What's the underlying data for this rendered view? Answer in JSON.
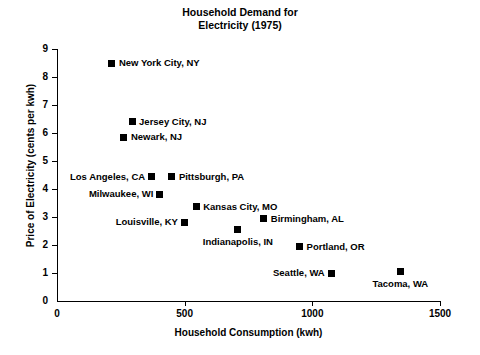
{
  "chart_data": {
    "type": "scatter",
    "title": "Household Demand for Electricity (1975)",
    "title_lines": [
      "Household Demand for",
      "Electricity (1975)"
    ],
    "xlabel": "Household Consumption (kwh)",
    "ylabel": "Price of Electricity (cents per kwh)",
    "xlim": [
      0,
      1500
    ],
    "ylim": [
      0,
      9
    ],
    "xticks": [
      0,
      500,
      1000,
      1500
    ],
    "yticks": [
      0,
      1,
      2,
      3,
      4,
      5,
      6,
      7,
      8,
      9
    ],
    "grid": false,
    "legend": "none",
    "marker": "filled-square",
    "marker_color": "#000000",
    "points": [
      {
        "label": "New York City, NY",
        "x": 215,
        "y": 8.5,
        "side": "right"
      },
      {
        "label": "Jersey City, NJ",
        "x": 294,
        "y": 6.4,
        "side": "right"
      },
      {
        "label": "Newark, NJ",
        "x": 262,
        "y": 5.85,
        "side": "right"
      },
      {
        "label": "Los Angeles, CA",
        "x": 372,
        "y": 4.43,
        "side": "left"
      },
      {
        "label": "Pittsburgh, PA",
        "x": 450,
        "y": 4.43,
        "side": "right"
      },
      {
        "label": "Milwaukee, WI",
        "x": 403,
        "y": 3.82,
        "side": "left"
      },
      {
        "label": "Kansas City, MO",
        "x": 545,
        "y": 3.36,
        "side": "right"
      },
      {
        "label": "Birmingham, AL",
        "x": 810,
        "y": 2.93,
        "side": "right"
      },
      {
        "label": "Louisville, KY",
        "x": 500,
        "y": 2.82,
        "side": "left"
      },
      {
        "label": "Indianapolis, IN",
        "x": 708,
        "y": 2.54,
        "side": "below"
      },
      {
        "label": "Portland, OR",
        "x": 950,
        "y": 1.93,
        "side": "right"
      },
      {
        "label": "Seattle, WA",
        "x": 1077,
        "y": 1.0,
        "side": "left"
      },
      {
        "label": "Tacoma, WA",
        "x": 1345,
        "y": 1.05,
        "side": "below"
      }
    ]
  }
}
